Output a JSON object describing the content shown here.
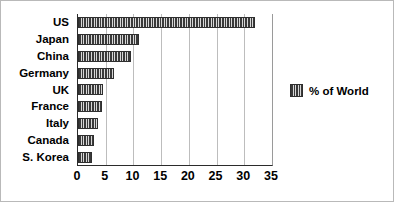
{
  "chart_data": {
    "type": "bar",
    "orientation": "horizontal",
    "title": "",
    "xlabel": "",
    "ylabel": "",
    "categories": [
      "US",
      "Japan",
      "China",
      "Germany",
      "UK",
      "France",
      "Italy",
      "Canada",
      "S. Korea"
    ],
    "series": [
      {
        "name": "% of World",
        "values": [
          32.0,
          11.0,
          9.6,
          6.5,
          4.6,
          4.4,
          3.6,
          2.8,
          2.6
        ]
      }
    ],
    "xlim": [
      0,
      35
    ],
    "xticks": [
      0,
      5,
      10,
      15,
      20,
      25,
      30,
      35
    ],
    "xtick_labels": [
      "0",
      "5",
      "10",
      "15",
      "20",
      "25",
      "30",
      "35"
    ],
    "grid": "vertical",
    "legend": {
      "position": "right",
      "entries": [
        {
          "label": "% of World",
          "swatch": "hatch-vertical-stripes",
          "color": "#3a3a3a"
        }
      ]
    }
  },
  "colors": {
    "bar": "#3a3a3a",
    "bar_hatch_light": "#d8d8d8",
    "axis": "#2b2b2b",
    "gridline": "#bdbdbd",
    "text": "#000000",
    "background": "#ffffff",
    "border": "#b9b9b9"
  }
}
